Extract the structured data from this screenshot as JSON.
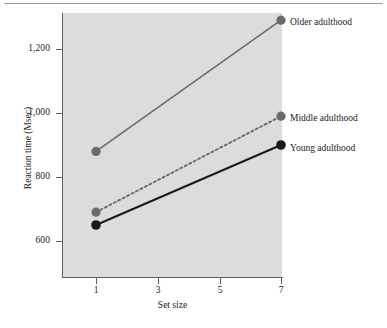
{
  "chart_data": {
    "type": "line",
    "title": "",
    "xlabel": "Set size",
    "ylabel": "Reaction time (Msec)",
    "x": [
      1,
      7
    ],
    "xticks": [
      1,
      3,
      5,
      7
    ],
    "xtick_labels": [
      "1",
      "3",
      "5",
      "7"
    ],
    "xlim": [
      0.3,
      7.7
    ],
    "yticks": [
      600,
      800,
      1000,
      1200
    ],
    "ytick_labels": [
      "600",
      "800",
      "1,000",
      "1,200"
    ],
    "ylim": [
      510,
      1350
    ],
    "grid": false,
    "legend_position": "right-of-points",
    "series": [
      {
        "name": "Older adulthood",
        "values": [
          880,
          1290
        ],
        "color": "#6b6b6b",
        "line_style": "solid",
        "marker": "circle",
        "label_y": 23
      },
      {
        "name": "Middle adulthood",
        "values": [
          690,
          990
        ],
        "color": "#6b6b6b",
        "line_style": "dotted",
        "marker": "circle",
        "label_y": 119
      },
      {
        "name": "Young adulthood",
        "values": [
          650,
          900
        ],
        "color": "#1a1a1a",
        "line_style": "solid",
        "marker": "circle",
        "label_y": 149
      }
    ]
  },
  "axes": {
    "y_title": "Reaction time (Msec)",
    "x_title": "Set size",
    "y_tick_labels": [
      "1,200",
      "1,000",
      "800",
      "600"
    ],
    "x_tick_labels": [
      "1",
      "3",
      "5",
      "7"
    ]
  },
  "labels": {
    "older": "Older adulthood",
    "middle": "Middle adulthood",
    "young": "Young adulthood"
  },
  "colors": {
    "plot_background": "#dcdcdc",
    "page_background": "#ffffff",
    "axis": "#5d5d5d",
    "gray_series": "#6b6b6b",
    "dark_series": "#1a1a1a",
    "text": "#1b1b1b"
  }
}
